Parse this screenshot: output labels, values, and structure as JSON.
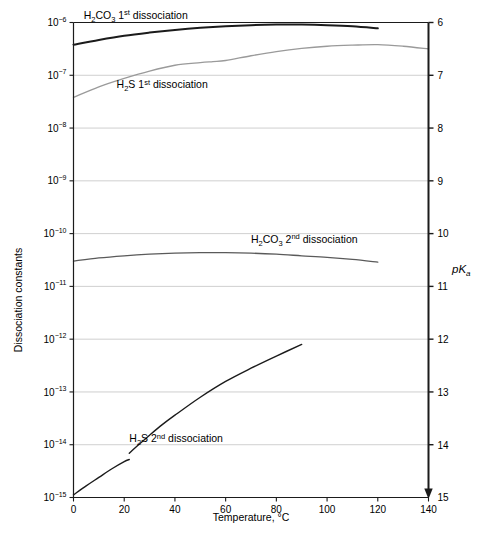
{
  "chart_data": {
    "type": "line",
    "title": "",
    "xlabel": "Temperature, °C",
    "ylabel": "Dissociation constants",
    "ylabel_right": "pKa",
    "xlim": [
      0,
      140
    ],
    "xticks": [
      0,
      20,
      40,
      60,
      80,
      100,
      120,
      140
    ],
    "xticklabels": [
      "0",
      "20",
      "40",
      "60",
      "80",
      "100",
      "120",
      "140"
    ],
    "ylim_log10": [
      -15,
      -6
    ],
    "yticks_exponent": [
      -6,
      -7,
      -8,
      -9,
      -10,
      -11,
      -12,
      -13,
      -14,
      -15
    ],
    "yticklabels": [
      "10⁻⁶",
      "10⁻⁷",
      "10⁻⁸",
      "10⁻⁹",
      "10⁻¹⁰",
      "10⁻¹¹",
      "10⁻¹²",
      "10⁻¹³",
      "10⁻¹⁴",
      "10⁻¹⁵"
    ],
    "yticks_right": [
      6,
      7,
      8,
      9,
      10,
      11,
      12,
      13,
      14,
      15
    ],
    "yticklabels_right": [
      "6",
      "7",
      "8",
      "9",
      "10",
      "11",
      "12",
      "13",
      "14",
      "15"
    ],
    "grid": true,
    "legend_position": "inline-annotations",
    "series": [
      {
        "name": "H2CO3 1st dissociation",
        "label_html_parts": {
          "formula_h": "H",
          "sub2": "2",
          "co": "CO",
          "sub3": "3",
          "ordinal_num": "1",
          "ordinal_suffix": "st",
          "word": "dissociation"
        },
        "label_text": "H2CO3 1st dissociation",
        "color": "#1b1b1b",
        "width": 2.0,
        "x": [
          0,
          10,
          20,
          30,
          40,
          50,
          60,
          70,
          80,
          90,
          100,
          110,
          120
        ],
        "pKa": [
          6.42,
          6.33,
          6.25,
          6.19,
          6.14,
          6.1,
          6.07,
          6.05,
          6.04,
          6.04,
          6.05,
          6.07,
          6.11
        ]
      },
      {
        "name": "H2S 1st dissociation",
        "label_html_parts": {
          "formula_h": "H",
          "sub2": "2",
          "co": "S",
          "sub3": "",
          "ordinal_num": "1",
          "ordinal_suffix": "st",
          "word": "dissociation"
        },
        "label_text": "H2S 1st dissociation",
        "color": "#9a9a9a",
        "width": 1.3,
        "x": [
          0,
          10,
          20,
          30,
          40,
          50,
          55,
          60,
          70,
          80,
          90,
          100,
          110,
          120,
          130,
          140
        ],
        "pKa": [
          7.42,
          7.22,
          7.06,
          6.92,
          6.81,
          6.76,
          6.74,
          6.72,
          6.63,
          6.55,
          6.49,
          6.45,
          6.43,
          6.42,
          6.45,
          6.5
        ]
      },
      {
        "name": "H2CO3 2nd dissociation",
        "label_html_parts": {
          "formula_h": "H",
          "sub2": "2",
          "co": "CO",
          "sub3": "3",
          "ordinal_num": "2",
          "ordinal_suffix": "nd",
          "word": "dissociation"
        },
        "label_text": "H2CO3 2nd dissociation",
        "color": "#5a5a5a",
        "width": 1.3,
        "x": [
          0,
          10,
          20,
          30,
          40,
          50,
          60,
          70,
          80,
          90,
          100,
          110,
          120
        ],
        "pKa": [
          10.52,
          10.46,
          10.42,
          10.39,
          10.37,
          10.36,
          10.36,
          10.37,
          10.39,
          10.42,
          10.45,
          10.49,
          10.54
        ]
      },
      {
        "name": "H2S 2nd dissociation",
        "label_html_parts": {
          "formula_h": "H",
          "sub2": "2",
          "co": "S",
          "sub3": "",
          "ordinal_num": "2",
          "ordinal_suffix": "nd",
          "word": "dissociation"
        },
        "label_text": "H2S 2nd dissociation",
        "color": "#1b1b1b",
        "width": 1.4,
        "x": [
          0,
          5,
          10,
          15,
          20,
          22,
          22,
          25,
          30,
          35,
          40,
          50,
          60,
          70,
          80,
          90
        ],
        "pKa": [
          14.95,
          14.78,
          14.62,
          14.46,
          14.32,
          14.28,
          14.16,
          14.03,
          13.82,
          13.62,
          13.44,
          13.1,
          12.8,
          12.55,
          12.32,
          12.1
        ]
      }
    ],
    "annotations": [
      {
        "text": "H2CO3 1st dissociation",
        "x_temp": 4,
        "pKa": 5.93
      },
      {
        "text": "H2S 1st dissociation",
        "x_temp": 17,
        "pKa": 7.25
      },
      {
        "text": "H2CO3 2nd dissociation",
        "x_temp": 70,
        "pKa": 10.17
      },
      {
        "text": "H2S 2nd dissociation",
        "x_temp": 22,
        "pKa": 13.95
      }
    ]
  },
  "axes": {
    "left_title": "Dissociation constants",
    "right_title_p": "p",
    "right_title_k": "K",
    "right_title_sub": "a",
    "bottom_title": "Temperature, °C"
  },
  "colors": {
    "background": "#ffffff",
    "frame": "#1b1b1b",
    "grid": "#c9c9c9",
    "text": "#000000",
    "series_dark": "#1b1b1b",
    "series_mid": "#5a5a5a",
    "series_light": "#9a9a9a"
  }
}
